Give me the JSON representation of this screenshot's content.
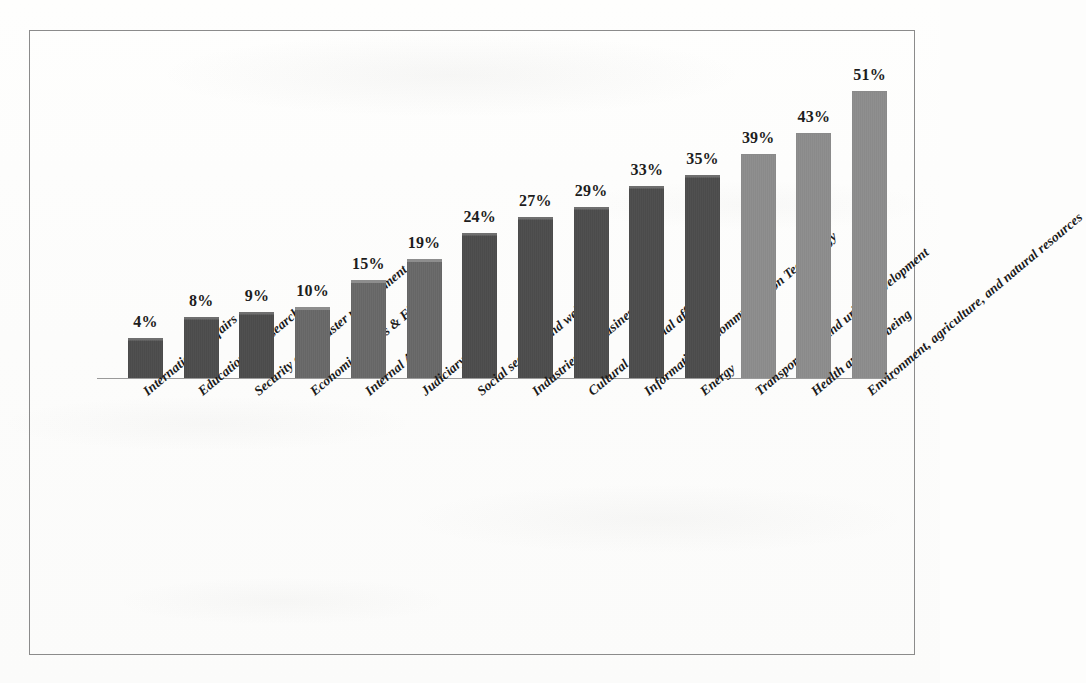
{
  "figure": {
    "frame_color": "#8b8b8b",
    "background_color": "#fdfdfc",
    "axis_color": "#9a9a9a"
  },
  "chart_data": {
    "type": "bar",
    "title": "",
    "subtitle": "",
    "xlabel": "",
    "ylabel": "",
    "ylim": [
      0,
      55
    ],
    "grid": false,
    "legend": null,
    "value_label_suffix": "%",
    "categories": [
      "International Affairs",
      "Education & Research",
      "Security and disaster management",
      "Economic Affairs & Finance",
      "Internal Affairs",
      "Judiciary",
      "Social security and welfare",
      "Industries and businesses",
      "Cultural and social affairs",
      "Information & Communication Technology",
      "Energy",
      "Transportation and urban development",
      "Health and well-being",
      "Environment, agriculture, and natural resources"
    ],
    "values": [
      4,
      8,
      9,
      10,
      15,
      19,
      24,
      27,
      29,
      33,
      35,
      39,
      43,
      51
    ],
    "value_labels": [
      "4%",
      "8%",
      "9%",
      "10%",
      "15%",
      "19%",
      "24%",
      "27%",
      "29%",
      "33%",
      "35%",
      "39%",
      "43%",
      "51%"
    ],
    "bar_shades": [
      "dark",
      "dark",
      "dark",
      "mid",
      "mid",
      "mid",
      "dark",
      "dark",
      "dark",
      "dark",
      "dark",
      "light",
      "light",
      "light"
    ],
    "colors": {
      "dark": "#4b4b4b",
      "mid": "#6a6a6a",
      "light": "#8a8a8a"
    }
  }
}
